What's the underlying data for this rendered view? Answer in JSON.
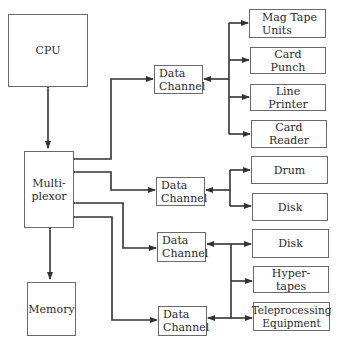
{
  "diagram": {
    "title": "",
    "nodes": {
      "cpu": {
        "label": "CPU"
      },
      "multiplexor": {
        "label": "Multi-\nplexor"
      },
      "memory": {
        "label": "Memory"
      },
      "data_channel_1": {
        "label": "Data\nChannel"
      },
      "data_channel_2": {
        "label": "Data\nChannel"
      },
      "data_channel_3": {
        "label": "Data\nChannel"
      },
      "data_channel_4": {
        "label": "Data\nChannel"
      },
      "mag_tape_units": {
        "label": "Mag Tape\nUnits"
      },
      "card_punch": {
        "label": "Card\nPunch"
      },
      "line_printer": {
        "label": "Line\nPrinter"
      },
      "card_reader": {
        "label": "Card\nReader"
      },
      "drum": {
        "label": "Drum"
      },
      "disk_1": {
        "label": "Disk"
      },
      "disk_2": {
        "label": "Disk"
      },
      "hyper_tapes": {
        "label": "Hyper-\ntapes"
      },
      "teleprocessing_equipment": {
        "label": "Teleprocessing\nEquipment"
      }
    },
    "edges": [
      {
        "from": "cpu",
        "to": "multiplexor",
        "direction": "both"
      },
      {
        "from": "multiplexor",
        "to": "memory",
        "direction": "both"
      },
      {
        "from": "multiplexor",
        "to": "data_channel_1",
        "direction": "both"
      },
      {
        "from": "multiplexor",
        "to": "data_channel_2",
        "direction": "both"
      },
      {
        "from": "multiplexor",
        "to": "data_channel_3",
        "direction": "both"
      },
      {
        "from": "multiplexor",
        "to": "data_channel_4",
        "direction": "both"
      },
      {
        "from": "data_channel_1",
        "to": [
          "mag_tape_units",
          "card_punch",
          "line_printer",
          "card_reader"
        ]
      },
      {
        "from": "data_channel_2",
        "to": [
          "drum",
          "disk_1"
        ]
      },
      {
        "from": [
          "data_channel_3",
          "data_channel_4"
        ],
        "to": [
          "disk_2",
          "hyper_tapes",
          "teleprocessing_equipment"
        ]
      }
    ],
    "colors": {
      "line": "#333333",
      "border": "#6a6a6a",
      "text": "#2a2a2a",
      "background": "#ffffff"
    }
  }
}
